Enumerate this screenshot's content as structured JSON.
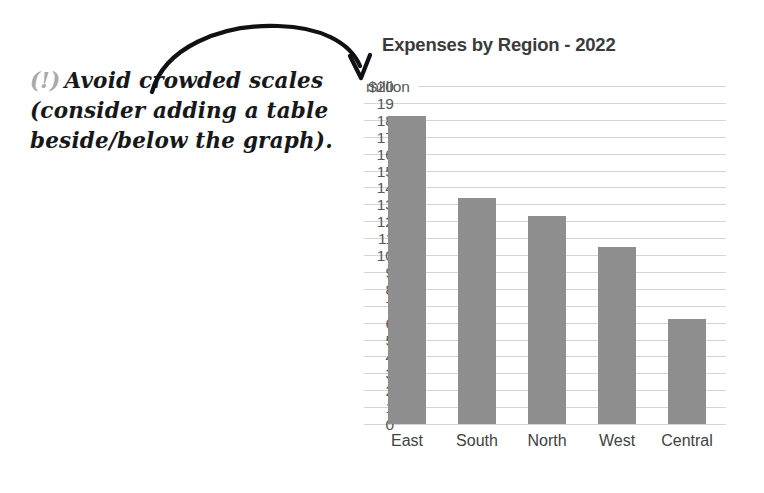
{
  "annotation": {
    "marker": "(!)",
    "line1": "Avoid crowded scales",
    "line2": "(consider adding a table",
    "line3": "beside/below the graph)."
  },
  "arrow": {
    "name": "curved-arrow-pointing-to-axis-top"
  },
  "chart_data": {
    "type": "bar",
    "title": "Expenses by Region - 2022",
    "xlabel": "",
    "ylabel": "$ million",
    "y_axis_top_label": "$20",
    "y_axis_unit_label": "million",
    "categories": [
      "East",
      "South",
      "North",
      "West",
      "Central"
    ],
    "values": [
      18.2,
      13.4,
      12.3,
      10.5,
      6.2
    ],
    "ylim": [
      0,
      20
    ],
    "ytick_step": 1,
    "ytick_labels": [
      "$20",
      "19",
      "18",
      "17",
      "16",
      "15",
      "14",
      "13",
      "12",
      "11",
      "10",
      "9",
      "8",
      "7",
      "6",
      "5",
      "4",
      "3",
      "2",
      "1",
      "0"
    ],
    "grid": true,
    "legend": "none",
    "bar_color": "#8e8e8e",
    "grid_color": "#d2d4d6",
    "title_color": "#3a3a3a"
  }
}
